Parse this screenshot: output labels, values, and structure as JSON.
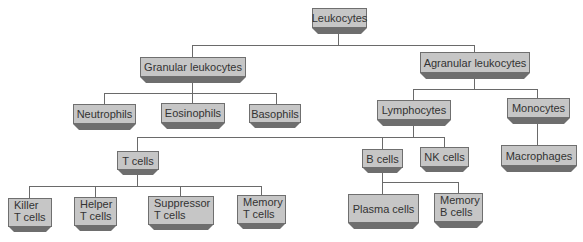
{
  "diagram": {
    "colors": {
      "box_fill": "#c6c6c6",
      "box_border": "#6f6f6f",
      "bevel": "#6e6e6e",
      "connector": "#6a6a6a",
      "text": "#333333"
    },
    "nodes": {
      "leukocytes": {
        "label": "Leukocytes"
      },
      "granular": {
        "label": "Granular leukocytes"
      },
      "agranular": {
        "label": "Agranular leukocytes"
      },
      "neutrophils": {
        "label": "Neutrophils"
      },
      "eosinophils": {
        "label": "Eosinophils"
      },
      "basophils": {
        "label": "Basophils"
      },
      "lymphocytes": {
        "label": "Lymphocytes"
      },
      "monocytes": {
        "label": "Monocytes"
      },
      "t_cells": {
        "label": "T cells"
      },
      "b_cells": {
        "label": "B cells"
      },
      "nk_cells": {
        "label": "NK cells"
      },
      "macrophages": {
        "label": "Macrophages"
      },
      "killer_t": {
        "line1": "Killer",
        "line2": "T cells"
      },
      "helper_t": {
        "line1": "Helper",
        "line2": "T cells"
      },
      "suppressor_t": {
        "line1": "Suppressor",
        "line2": "T cells"
      },
      "memory_t": {
        "line1": "Memory",
        "line2": "T cells"
      },
      "plasma": {
        "label": "Plasma cells"
      },
      "memory_b": {
        "line1": "Memory",
        "line2": "B cells"
      }
    },
    "edges": [
      [
        "Leukocytes",
        "Granular leukocytes"
      ],
      [
        "Leukocytes",
        "Agranular leukocytes"
      ],
      [
        "Granular leukocytes",
        "Neutrophils"
      ],
      [
        "Granular leukocytes",
        "Eosinophils"
      ],
      [
        "Granular leukocytes",
        "Basophils"
      ],
      [
        "Agranular leukocytes",
        "Lymphocytes"
      ],
      [
        "Agranular leukocytes",
        "Monocytes"
      ],
      [
        "Lymphocytes",
        "T cells"
      ],
      [
        "Lymphocytes",
        "B cells"
      ],
      [
        "Lymphocytes",
        "NK cells"
      ],
      [
        "Monocytes",
        "Macrophages"
      ],
      [
        "T cells",
        "Killer T cells"
      ],
      [
        "T cells",
        "Helper T cells"
      ],
      [
        "T cells",
        "Suppressor T cells"
      ],
      [
        "T cells",
        "Memory T cells"
      ],
      [
        "B cells",
        "Plasma cells"
      ],
      [
        "B cells",
        "Memory B cells"
      ]
    ]
  }
}
